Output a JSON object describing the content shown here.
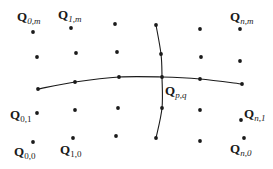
{
  "diagram": {
    "colors": {
      "ink": "#1a1a1a",
      "background": "#ffffff"
    },
    "grid_points": [
      [
        33,
        32
      ],
      [
        71,
        28
      ],
      [
        115,
        24
      ],
      [
        156,
        25
      ],
      [
        200,
        29
      ],
      [
        240,
        29
      ],
      [
        37,
        57
      ],
      [
        76,
        53
      ],
      [
        117,
        52
      ],
      [
        161,
        54
      ],
      [
        201,
        57
      ],
      [
        240,
        61
      ],
      [
        37,
        113
      ],
      [
        75,
        110
      ],
      [
        118,
        108
      ],
      [
        162,
        108
      ],
      [
        200,
        110
      ],
      [
        241,
        120
      ],
      [
        33,
        142
      ],
      [
        73,
        138
      ],
      [
        116,
        136
      ],
      [
        156,
        138
      ],
      [
        200,
        141
      ],
      [
        244,
        138
      ]
    ],
    "horizontal_curve": {
      "points": [
        [
          38,
          89
        ],
        [
          75,
          82
        ],
        [
          119,
          77
        ],
        [
          162,
          77
        ],
        [
          200,
          79
        ],
        [
          242,
          84
        ]
      ]
    },
    "vertical_curve": {
      "points": [
        [
          156,
          25
        ],
        [
          161,
          54
        ],
        [
          162,
          77
        ],
        [
          162,
          108
        ],
        [
          156,
          138
        ]
      ]
    },
    "labels": {
      "q0m": {
        "main": "Q",
        "sub": "0,m",
        "x": 17,
        "y": 21
      },
      "q1m": {
        "main": "Q",
        "sub": "1,m",
        "x": 58,
        "y": 19
      },
      "qnm": {
        "main": "Q",
        "sub": "n,m",
        "x": 230,
        "y": 21
      },
      "q01": {
        "main": "Q",
        "sub": "0,1",
        "x": 10,
        "y": 119
      },
      "q00": {
        "main": "Q",
        "sub": "0,0",
        "x": 14,
        "y": 156
      },
      "q10": {
        "main": "Q",
        "sub": "1,0",
        "x": 60,
        "y": 154
      },
      "qn1": {
        "main": "Q",
        "sub": "n,1",
        "x": 244,
        "y": 118
      },
      "qn0": {
        "main": "Q",
        "sub": "n,0",
        "x": 230,
        "y": 153
      },
      "qpq": {
        "main": "Q",
        "sub": "p,q",
        "x": 165,
        "y": 95
      }
    }
  }
}
